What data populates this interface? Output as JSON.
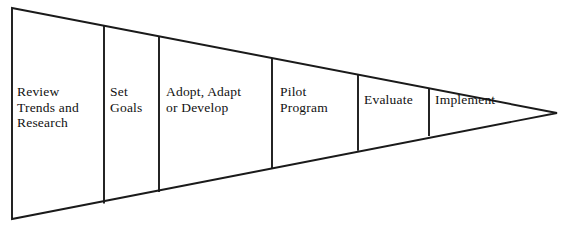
{
  "diagram": {
    "type": "funnel-process-diagram",
    "shape": "triangle-pointing-right",
    "orientation": "horizontal",
    "background_color": "#ffffff",
    "stroke_color": "#1a1a1a",
    "text_color": "#111111",
    "apex": {
      "x": 557,
      "y": 113
    },
    "base_top": {
      "x": 12,
      "y": 8
    },
    "base_bottom": {
      "x": 12,
      "y": 219
    },
    "divider_x_positions": [
      104,
      159,
      272,
      358,
      429
    ],
    "stages": [
      {
        "id": "stage-1",
        "order": 1,
        "label": "Review\nTrends and\nResearch",
        "lines": [
          "Review",
          "Trends and",
          "Research"
        ]
      },
      {
        "id": "stage-2",
        "order": 2,
        "label": "Set\nGoals",
        "lines": [
          "Set",
          "Goals"
        ]
      },
      {
        "id": "stage-3",
        "order": 3,
        "label": "Adopt, Adapt\nor Develop",
        "lines": [
          "Adopt, Adapt",
          "or Develop"
        ]
      },
      {
        "id": "stage-4",
        "order": 4,
        "label": "Pilot\nProgram",
        "lines": [
          "Pilot",
          "Program"
        ]
      },
      {
        "id": "stage-5",
        "order": 5,
        "label": "Evaluate",
        "lines": [
          "Evaluate"
        ]
      },
      {
        "id": "stage-6",
        "order": 6,
        "label": "Implement",
        "lines": [
          "Implement"
        ]
      }
    ]
  }
}
